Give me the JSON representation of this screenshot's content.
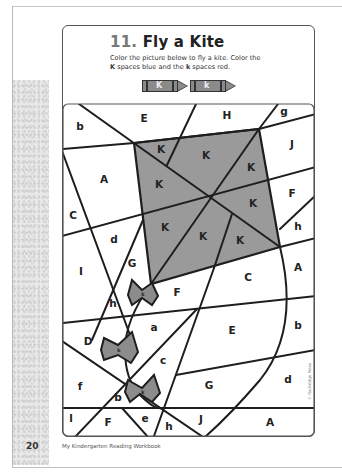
{
  "page": {
    "number": "20",
    "footer": "My Kindergarten Reading Workbook",
    "copyright": "© Rockridge Press"
  },
  "activity": {
    "number": "11.",
    "title": "Fly a Kite",
    "instructions_line1": "Color the picture below to fly a kite. Color the",
    "instructions_bold1": "K",
    "instructions_mid": " spaces blue and the ",
    "instructions_bold2": "k",
    "instructions_end": " spaces red.",
    "crayons": [
      {
        "letter": "K",
        "color_name": "blue"
      },
      {
        "letter": "k",
        "color_name": "red"
      }
    ]
  },
  "colors": {
    "kite_fill": "#9a9a9a",
    "bow_fill": "#8c8c8c",
    "line": "#1e1e1e"
  },
  "regions": [
    {
      "letter": "b",
      "x": 80,
      "y": 127
    },
    {
      "letter": "E",
      "x": 144,
      "y": 119
    },
    {
      "letter": "H",
      "x": 227,
      "y": 116
    },
    {
      "letter": "g",
      "x": 284,
      "y": 112
    },
    {
      "letter": "K",
      "x": 161,
      "y": 150
    },
    {
      "letter": "K",
      "x": 206,
      "y": 156
    },
    {
      "letter": "J",
      "x": 292,
      "y": 145
    },
    {
      "letter": "A",
      "x": 104,
      "y": 180
    },
    {
      "letter": "K",
      "x": 159,
      "y": 185
    },
    {
      "letter": "K",
      "x": 251,
      "y": 168
    },
    {
      "letter": "F",
      "x": 292,
      "y": 194
    },
    {
      "letter": "C",
      "x": 73,
      "y": 216
    },
    {
      "letter": "K",
      "x": 253,
      "y": 204
    },
    {
      "letter": "d",
      "x": 114,
      "y": 240
    },
    {
      "letter": "K",
      "x": 165,
      "y": 228
    },
    {
      "letter": "K",
      "x": 203,
      "y": 237
    },
    {
      "letter": "K",
      "x": 240,
      "y": 241
    },
    {
      "letter": "h",
      "x": 298,
      "y": 227
    },
    {
      "letter": "G",
      "x": 132,
      "y": 264
    },
    {
      "letter": "I",
      "x": 81,
      "y": 272
    },
    {
      "letter": "C",
      "x": 248,
      "y": 278
    },
    {
      "letter": "A",
      "x": 298,
      "y": 268
    },
    {
      "letter": "F",
      "x": 177,
      "y": 293
    },
    {
      "letter": "h",
      "x": 113,
      "y": 304
    },
    {
      "letter": "a",
      "x": 154,
      "y": 328
    },
    {
      "letter": "E",
      "x": 232,
      "y": 331
    },
    {
      "letter": "b",
      "x": 298,
      "y": 326
    },
    {
      "letter": "D",
      "x": 88,
      "y": 342
    },
    {
      "letter": "c",
      "x": 163,
      "y": 361
    },
    {
      "letter": "G",
      "x": 209,
      "y": 386
    },
    {
      "letter": "d",
      "x": 288,
      "y": 380
    },
    {
      "letter": "f",
      "x": 80,
      "y": 387
    },
    {
      "letter": "b",
      "x": 118,
      "y": 398
    },
    {
      "letter": "l",
      "x": 71,
      "y": 419
    },
    {
      "letter": "F",
      "x": 108,
      "y": 423
    },
    {
      "letter": "e",
      "x": 145,
      "y": 419
    },
    {
      "letter": "h",
      "x": 169,
      "y": 427
    },
    {
      "letter": "J",
      "x": 201,
      "y": 420
    },
    {
      "letter": "A",
      "x": 270,
      "y": 423
    }
  ],
  "bow_letter": "k"
}
